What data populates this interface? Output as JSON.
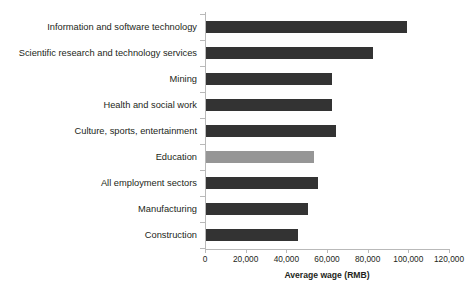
{
  "figure": {
    "title_remnant": "",
    "background_color": "#ffffff"
  },
  "chart_data": {
    "type": "bar",
    "orientation": "horizontal",
    "title": "",
    "xlabel": "Average wage (RMB)",
    "ylabel": "",
    "xlim": [
      0,
      120000
    ],
    "xticks": [
      0,
      20000,
      40000,
      60000,
      80000,
      100000,
      120000
    ],
    "xticklabels": [
      "0",
      "20,000",
      "40,000",
      "60,000",
      "80,000",
      "100,000",
      "120,000"
    ],
    "grid": false,
    "legend": null,
    "bar_color": "#333333",
    "highlight_color": "#969696",
    "axis_color": "#b9b9b9",
    "categories": [
      "Information and software technology",
      "Scientific research and technology services",
      "Mining",
      "Health and social work",
      "Culture, sports, entertainment",
      "Education",
      "All employment sectors",
      "Manufacturing",
      "Construction"
    ],
    "values": [
      99000,
      82000,
      62000,
      62000,
      64000,
      53000,
      55000,
      50000,
      45000
    ],
    "bars": [
      {
        "label": "Information and software technology",
        "value": 99000,
        "highlight": false
      },
      {
        "label": "Scientific research and technology services",
        "value": 82000,
        "highlight": false
      },
      {
        "label": "Mining",
        "value": 62000,
        "highlight": false
      },
      {
        "label": "Health and social work",
        "value": 62000,
        "highlight": false
      },
      {
        "label": "Culture, sports, entertainment",
        "value": 64000,
        "highlight": false
      },
      {
        "label": "Education",
        "value": 53000,
        "highlight": true
      },
      {
        "label": "All employment sectors",
        "value": 55000,
        "highlight": false
      },
      {
        "label": "Manufacturing",
        "value": 50000,
        "highlight": false
      },
      {
        "label": "Construction",
        "value": 45000,
        "highlight": false
      }
    ]
  }
}
